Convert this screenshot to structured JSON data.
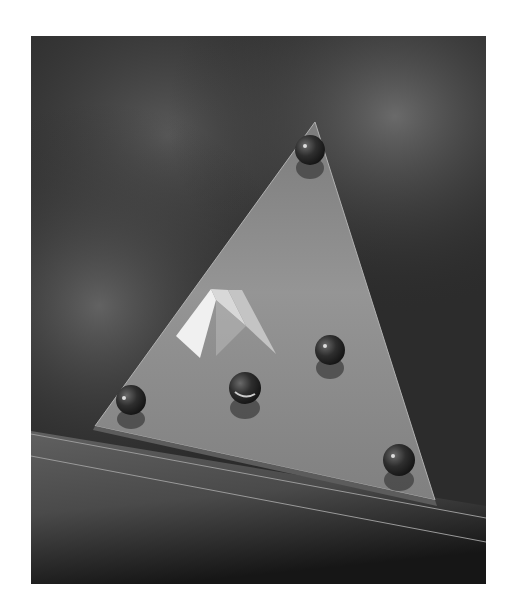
{
  "image": {
    "alt": "Black-and-white still life: a glass triangular plate resting on a stormy cloud backdrop, with five glass marbles and a small white paper pyramid on it",
    "frame": {
      "x": 31,
      "y": 36,
      "width": 455,
      "height": 548
    },
    "background_color": "#ffffff",
    "colors": {
      "sky_dark": "#1e1e1e",
      "sky_mid": "#3c3c3c",
      "sky_light": "#6a6a6a",
      "glass_plate": "#8a8a8a",
      "glass_plate_light": "#a6a6a6",
      "pyramid_light": "#f2f2f2",
      "pyramid_shade": "#cfcfcf",
      "marble": "#2a2a2a",
      "floor_line": "#9a9a9a"
    },
    "objects": {
      "triangle": {
        "top": [
          284,
          86
        ],
        "bottom_left": [
          64,
          390
        ],
        "bottom_right": [
          404,
          464
        ]
      },
      "pyramid": {
        "apex": [
          65,
          230
        ],
        "left": [
          -30,
          270
        ],
        "right": [
          110,
          318
        ]
      },
      "marbles": [
        {
          "name": "marble-top",
          "cx": 279,
          "cy": 114,
          "r": 15
        },
        {
          "name": "marble-right-middle",
          "cx": 299,
          "cy": 314,
          "r": 15
        },
        {
          "name": "marble-center",
          "cx": 214,
          "cy": 352,
          "r": 16
        },
        {
          "name": "marble-left",
          "cx": 100,
          "cy": 364,
          "r": 15
        },
        {
          "name": "marble-bottom-right",
          "cx": 368,
          "cy": 424,
          "r": 16
        }
      ]
    }
  }
}
